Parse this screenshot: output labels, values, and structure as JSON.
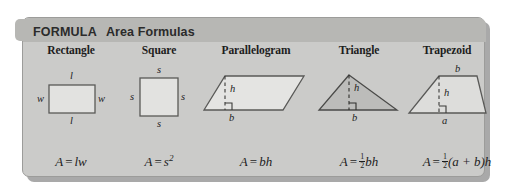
{
  "card": {
    "kicker": "FORMULA",
    "title": "Area Formulas",
    "bg_color": "#cbcbc9",
    "header_color": "#b7b7b4"
  },
  "columns": [
    {
      "id": "rectangle",
      "title": "Rectangle",
      "shape": "rectangle",
      "fill": "#e2e2e0",
      "labels": {
        "top": "l",
        "bottom": "l",
        "left": "w",
        "right": "w"
      },
      "formula": {
        "lhs": "A",
        "eq": "=",
        "rhs": "lw"
      }
    },
    {
      "id": "square",
      "title": "Square",
      "shape": "square",
      "fill": "#e2e2e0",
      "labels": {
        "top": "s",
        "bottom": "s",
        "left": "s",
        "right": "s"
      },
      "formula": {
        "lhs": "A",
        "eq": "=",
        "rhs": "s",
        "exponent": "2"
      }
    },
    {
      "id": "parallelogram",
      "title": "Parallelogram",
      "shape": "parallelogram",
      "fill": "#e4e4e2",
      "labels": {
        "height": "h",
        "base": "b"
      },
      "formula": {
        "lhs": "A",
        "eq": "=",
        "rhs": "bh"
      }
    },
    {
      "id": "triangle",
      "title": "Triangle",
      "shape": "triangle",
      "fill": "#bcbcba",
      "labels": {
        "height": "h",
        "base": "b"
      },
      "formula": {
        "lhs": "A",
        "eq": "=",
        "frac_num": "1",
        "frac_den": "2",
        "rhs": "bh"
      }
    },
    {
      "id": "trapezoid",
      "title": "Trapezoid",
      "shape": "trapezoid",
      "fill": "#dddddb",
      "labels": {
        "top": "b",
        "height": "h",
        "bottom": "a"
      },
      "formula": {
        "lhs": "A",
        "eq": "=",
        "frac_num": "1",
        "frac_den": "2",
        "rhs": "(a + b)h"
      }
    }
  ]
}
